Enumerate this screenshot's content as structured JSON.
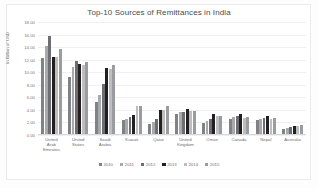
{
  "chart_data": {
    "type": "bar",
    "title": "Top-10 Sources of Remittances in India",
    "xlabel": "",
    "ylabel": "In Billion of USD",
    "ylim": [
      0,
      18
    ],
    "ytick_step": 2,
    "yticks": [
      "18.00",
      "16.00",
      "14.00",
      "12.00",
      "10.00",
      "8.00",
      "6.00",
      "4.00",
      "2.00",
      "0.00"
    ],
    "grid": true,
    "legend_position": "bottom",
    "categories": [
      "United Arab Emirates",
      "United States",
      "Saudi Arabia",
      "Kuwait",
      "Qatar",
      "United Kingdom",
      "Oman",
      "Canada",
      "Nepal",
      "Australia"
    ],
    "series": [
      {
        "name": "2010",
        "color": "#808285",
        "values": [
          12.2,
          9.3,
          5.3,
          2.4,
          1.8,
          3.4,
          1.95,
          2.6,
          2.4,
          1.0
        ]
      },
      {
        "name": "2011",
        "color": "#a7a9ac",
        "values": [
          14.2,
          10.8,
          6.4,
          2.6,
          2.1,
          3.6,
          2.2,
          2.8,
          2.6,
          1.15
        ]
      },
      {
        "name": "2012",
        "color": "#6d6e71",
        "values": [
          15.8,
          11.8,
          8.2,
          2.9,
          2.6,
          3.7,
          2.5,
          3.1,
          2.7,
          1.3
        ]
      },
      {
        "name": "2013",
        "color": "#231f20",
        "values": [
          12.5,
          11.3,
          10.7,
          3.2,
          4.0,
          4.1,
          3.3,
          3.3,
          3.0,
          1.4
        ]
      },
      {
        "name": "2014",
        "color": "#bcbec0",
        "values": [
          12.4,
          11.1,
          10.5,
          4.6,
          4.05,
          3.75,
          3.05,
          2.7,
          2.55,
          1.45
        ]
      },
      {
        "name": "2015",
        "color": "#9a9c9f",
        "values": [
          13.7,
          11.7,
          11.1,
          4.6,
          4.55,
          3.8,
          3.1,
          2.8,
          2.75,
          1.6
        ]
      }
    ]
  }
}
